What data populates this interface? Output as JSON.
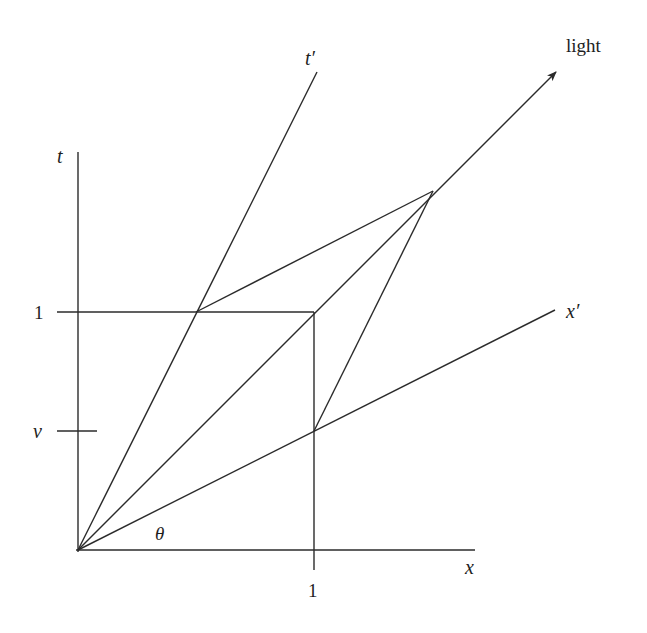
{
  "figure": {
    "labels": {
      "t_axis": "t",
      "x_axis": "x",
      "t_prime_axis": "t′",
      "x_prime_axis": "x′",
      "light": "light",
      "theta": "θ",
      "t_unit": "1",
      "x_unit": "1",
      "v_tick": "v"
    },
    "colors": {
      "stroke": "#2b2b2b",
      "text": "#1e1e1e",
      "background": "#ffffff"
    },
    "geometry": {
      "origin": [
        0,
        0
      ],
      "unit_square_corner": [
        1,
        1
      ],
      "v": 0.5,
      "t_prime_axis_through": [
        0.5,
        1
      ],
      "x_prime_axis_through": [
        1,
        0.5
      ],
      "parallelogram_apex": [
        1.5,
        1.5
      ],
      "light_slope": 1
    }
  }
}
